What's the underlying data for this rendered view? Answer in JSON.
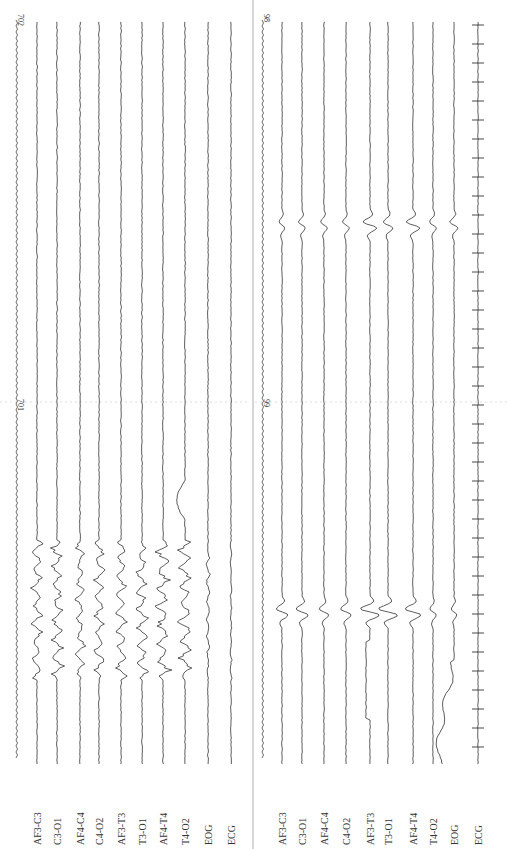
{
  "figure": {
    "type": "EEG recording (rotated 90°)",
    "panels": [
      {
        "id": "top",
        "time_markers": [
          {
            "label": "702",
            "y": 10
          },
          {
            "label": "701",
            "y": 395
          }
        ],
        "channels": [
          "AF3-C3",
          "C3-O1",
          "AF4-C4",
          "C4-O2",
          "AF3-T3",
          "T3-O1",
          "AF4-T4",
          "T4-O2",
          "EOG",
          "ECG"
        ],
        "x_positions": [
          37,
          57,
          80,
          99,
          121,
          142,
          163,
          185,
          208,
          231
        ],
        "event_range": [
          540,
          680
        ],
        "event_amplitude": [
          6,
          7,
          6,
          6,
          6,
          7,
          8,
          7,
          2,
          1
        ]
      },
      {
        "id": "bottom",
        "time_markers": [
          {
            "label": "98",
            "y": 10
          },
          {
            "label": "99",
            "y": 395
          }
        ],
        "channels": [
          "AF3-C3",
          "C3-O1",
          "AF4-C4",
          "C4-O2",
          "AF3-T3",
          "T3-O1",
          "AF4-T4",
          "T4-O2",
          "EOG",
          "ECG"
        ],
        "x_positions": [
          282,
          302,
          324,
          346,
          370,
          388,
          413,
          433,
          454,
          478
        ],
        "spikes": [
          {
            "y": 225,
            "amp": [
              4,
              5,
              5,
              5,
              10,
              7,
              10,
              5,
              6,
              0
            ]
          },
          {
            "y": 612,
            "amp": [
              9,
              9,
              7,
              8,
              14,
              14,
              12,
              5,
              4,
              0
            ]
          }
        ]
      }
    ],
    "ecg_tick_spacing": 19
  }
}
